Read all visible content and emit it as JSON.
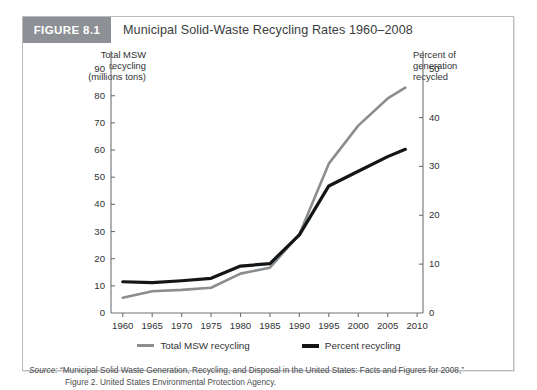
{
  "figure": {
    "tag": "FIGURE 8.1",
    "title": "Municipal Solid-Waste Recycling Rates 1960–2008"
  },
  "source": {
    "label": "Source:",
    "line1": " “Municipal Solid Waste Generation, Recycling, and Disposal in the United States: Facts and Figures for 2008,”",
    "line2": "Figure 2. United States Environmental Protection Agency."
  },
  "colors": {
    "tag_background": "#8d9094",
    "series_total_msw": "#8b8e90",
    "series_percent": "#141516",
    "axis": "#6e7072",
    "card_border": "#b9bcbe",
    "text": "#2f3133"
  },
  "chart_data": {
    "type": "line",
    "title": "Municipal Solid-Waste Recycling Rates 1960–2008",
    "xlabel": "",
    "ylabel": "Total MSW recycling (millions tons)",
    "y2label": "Percent of generation recycled",
    "left_axis_caption": "Total MSW\nrecycling\n(millions tons)",
    "right_axis_caption": "Percent of\ngeneration\nrecycled",
    "x": [
      1960,
      1965,
      1970,
      1975,
      1980,
      1985,
      1990,
      1995,
      2000,
      2005,
      2008
    ],
    "xlim": [
      1958,
      2011
    ],
    "xticks": [
      1960,
      1965,
      1970,
      1975,
      1980,
      1985,
      1990,
      1995,
      2000,
      2005,
      2010
    ],
    "ylim": [
      0,
      95
    ],
    "yticks": [
      0,
      10,
      20,
      30,
      40,
      50,
      60,
      70,
      80,
      90
    ],
    "y2lim": [
      0,
      52.8
    ],
    "y2ticks": [
      0,
      10,
      20,
      30,
      40,
      50
    ],
    "grid": false,
    "legend_position": "bottom-center",
    "series": [
      {
        "name": "Total MSW recycling",
        "axis": "left",
        "units": "millions tons",
        "color": "#8b8e90",
        "values": [
          5.6,
          8.0,
          8.5,
          9.3,
          14.5,
          16.7,
          29.0,
          55.0,
          69.0,
          79.0,
          83.0
        ]
      },
      {
        "name": "Percent recycling",
        "axis": "right",
        "units": "percent",
        "color": "#141516",
        "values": [
          6.4,
          6.2,
          6.6,
          7.1,
          9.6,
          10.1,
          16.0,
          26.0,
          29.0,
          32.0,
          33.5
        ]
      }
    ],
    "legend": [
      {
        "label": "Total MSW recycling",
        "color": "#8b8e90"
      },
      {
        "label": "Percent recycling",
        "color": "#141516"
      }
    ]
  }
}
